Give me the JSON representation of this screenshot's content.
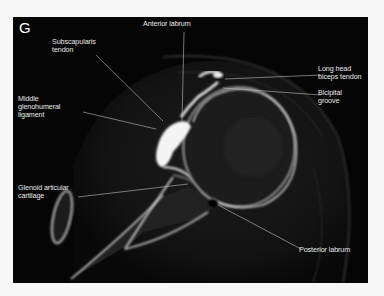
{
  "figure": {
    "panel_letter": "G",
    "image_type": "CT arthrogram, axial shoulder",
    "background_color": "#050505",
    "label_color": "#e8e8e8"
  },
  "labels": {
    "anterior_labrum": "Anterior labrum",
    "subscapularis_tendon": "Subscapularis\ntendon",
    "middle_glenohumeral_ligament": "Middle\nglenohumeral\nligament",
    "long_head_biceps_tendon": "Long head\nbiceps tendon",
    "bicipital_groove": "Bicipital\ngroove",
    "glenoid_articular_cartilage": "Glenoid articular\ncartilage",
    "posterior_labrum": "Posterior labrum"
  }
}
